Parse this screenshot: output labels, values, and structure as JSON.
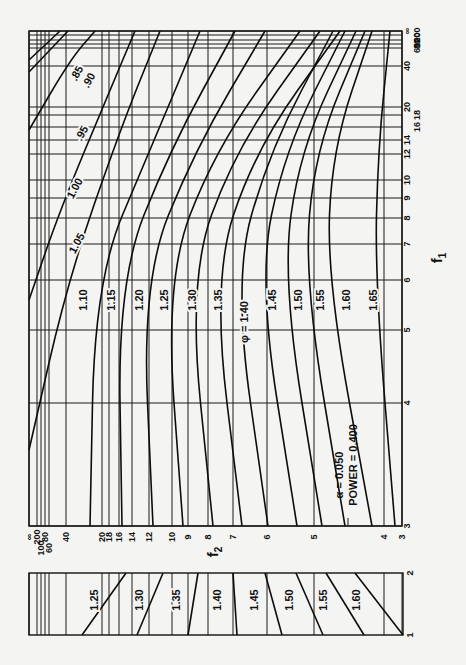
{
  "chart_data": {
    "type": "line",
    "annotation": {
      "alpha_label": "α = 0.050",
      "power_label": "POWER = 0.400"
    },
    "parameter_symbol": "φ",
    "f1_axis": {
      "label": "f1",
      "orientation": "vertical (right side, reads bottom→top)",
      "ticks": [
        "3",
        "4",
        "5",
        "6",
        "7",
        "8",
        "9",
        "10",
        "12",
        "14",
        "16",
        "18",
        "20",
        "40",
        "60",
        "80",
        "100",
        "200",
        "∞"
      ],
      "tick_y_px": [
        526,
        403,
        330,
        280,
        244,
        218,
        198,
        180,
        154,
        140,
        127,
        115,
        107,
        66,
        48,
        44,
        40,
        35,
        31
      ]
    },
    "f2_axis": {
      "label": "f2",
      "orientation": "horizontal (bottom, reads left ∞ → right 3)",
      "ticks": [
        "∞",
        "200",
        "100",
        "80",
        "60",
        "40",
        "20",
        "18",
        "16",
        "14",
        "12",
        "10",
        "9",
        "8",
        "7",
        "6",
        "5",
        "4",
        "3"
      ],
      "tick_x_px": [
        29,
        37,
        41,
        45,
        49,
        66,
        102,
        109,
        119,
        132,
        149,
        172,
        188,
        208,
        233,
        267,
        314,
        384,
        402
      ]
    },
    "main_series": [
      {
        "name": "0.85",
        "label": ".85",
        "path_px": [
          [
            29,
            60
          ],
          [
            60,
            31
          ]
        ]
      },
      {
        "name": "0.90",
        "label": ".90",
        "path_px": [
          [
            29,
            72
          ],
          [
            68,
            31
          ]
        ]
      },
      {
        "name": "0.95",
        "label": ".95",
        "path_px": [
          [
            29,
            130
          ],
          [
            70,
            60
          ],
          [
            95,
            31
          ]
        ]
      },
      {
        "name": "1.00",
        "label": "1.00",
        "path_px": [
          [
            29,
            300
          ],
          [
            60,
            210
          ],
          [
            110,
            90
          ],
          [
            135,
            31
          ]
        ]
      },
      {
        "name": "1.05",
        "label": "1.05",
        "path_px": [
          [
            29,
            450
          ],
          [
            68,
            280
          ],
          [
            120,
            130
          ],
          [
            160,
            31
          ]
        ]
      },
      {
        "name": "1.10",
        "label": "1.10",
        "path_px": [
          [
            90,
            526
          ],
          [
            95,
            280
          ],
          [
            150,
            150
          ],
          [
            200,
            31
          ]
        ]
      },
      {
        "name": "1.15",
        "label": "1.15",
        "path_px": [
          [
            122,
            526
          ],
          [
            118,
            280
          ],
          [
            170,
            150
          ],
          [
            235,
            31
          ]
        ]
      },
      {
        "name": "1.20",
        "label": "1.20",
        "path_px": [
          [
            153,
            526
          ],
          [
            142,
            280
          ],
          [
            195,
            150
          ],
          [
            265,
            31
          ]
        ]
      },
      {
        "name": "1.25",
        "label": "1.25",
        "path_px": [
          [
            183,
            526
          ],
          [
            165,
            280
          ],
          [
            215,
            150
          ],
          [
            300,
            31
          ]
        ]
      },
      {
        "name": "1.30",
        "label": "1.30",
        "path_px": [
          [
            213,
            526
          ],
          [
            188,
            280
          ],
          [
            235,
            150
          ],
          [
            320,
            31
          ]
        ]
      },
      {
        "name": "1.35",
        "label": "1.35",
        "path_px": [
          [
            242,
            526
          ],
          [
            212,
            280
          ],
          [
            255,
            150
          ],
          [
            340,
            31
          ]
        ]
      },
      {
        "name": "1.40",
        "label": "φ = 1.40",
        "path_px": [
          [
            268,
            526
          ],
          [
            233,
            280
          ],
          [
            270,
            150
          ],
          [
            333,
            31
          ]
        ]
      },
      {
        "name": "1.45",
        "label": "1.45",
        "path_px": [
          [
            297,
            526
          ],
          [
            258,
            280
          ],
          [
            285,
            150
          ],
          [
            345,
            31
          ]
        ]
      },
      {
        "name": "1.50",
        "label": "1.50",
        "path_px": [
          [
            322,
            526
          ],
          [
            282,
            280
          ],
          [
            300,
            150
          ],
          [
            356,
            31
          ]
        ]
      },
      {
        "name": "1.55",
        "label": "1.55",
        "path_px": [
          [
            345,
            526
          ],
          [
            304,
            280
          ],
          [
            315,
            150
          ],
          [
            365,
            31
          ]
        ]
      },
      {
        "name": "1.60",
        "label": "1.60",
        "path_px": [
          [
            372,
            526
          ],
          [
            327,
            280
          ],
          [
            332,
            150
          ],
          [
            372,
            31
          ]
        ]
      },
      {
        "name": "1.65",
        "label": "1.65",
        "path_px": [
          [
            395,
            526
          ],
          [
            375,
            280
          ],
          [
            378,
            150
          ],
          [
            390,
            31
          ]
        ]
      }
    ],
    "inset": {
      "f1_range": [
        "1",
        "2"
      ],
      "series": [
        {
          "name": "1.25",
          "top_x": 126,
          "bottom_x": 82
        },
        {
          "name": "1.30",
          "top_x": 163,
          "bottom_x": 137
        },
        {
          "name": "1.35",
          "top_x": 198,
          "bottom_x": 188
        },
        {
          "name": "1.40",
          "top_x": 233,
          "bottom_x": 237
        },
        {
          "name": "1.45",
          "top_x": 265,
          "bottom_x": 282
        },
        {
          "name": "1.50",
          "top_x": 296,
          "bottom_x": 323
        },
        {
          "name": "1.55",
          "top_x": 326,
          "bottom_x": 364
        },
        {
          "name": "1.60",
          "top_x": 355,
          "bottom_x": 403
        }
      ]
    },
    "layout": {
      "main_frame": {
        "left": 29,
        "top": 31,
        "right": 402,
        "bottom": 526
      },
      "inset_frame": {
        "left": 29,
        "top": 573,
        "right": 403,
        "bottom": 635
      },
      "grid": true,
      "rotation": "text rotated -90°"
    }
  }
}
